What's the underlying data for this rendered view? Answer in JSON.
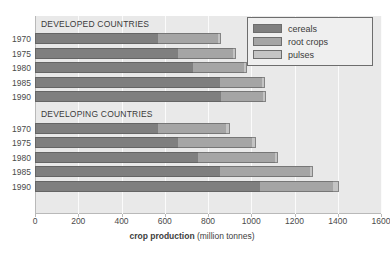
{
  "chart_data": {
    "type": "bar",
    "orientation": "horizontal",
    "stacked": true,
    "title": "",
    "xlabel_bold": "crop production",
    "xlabel_rest": " (million tonnes)",
    "ylabel": "",
    "xlim": [
      0,
      1600
    ],
    "xticks": [
      0,
      200,
      400,
      600,
      800,
      1000,
      1200,
      1400,
      1600
    ],
    "xtick_labels": [
      "0",
      "200",
      "400",
      "600",
      "800",
      "1000",
      "1200",
      "1400",
      "1600"
    ],
    "grid": true,
    "grid_axis": "x",
    "legend_position": "top-right",
    "legend": [
      "cereals",
      "root crops",
      "pulses"
    ],
    "series": [
      {
        "name": "cereals",
        "color": "#7f7f7f"
      },
      {
        "name": "root crops",
        "color": "#a5a5a5"
      },
      {
        "name": "pulses",
        "color": "#c4c4c4"
      }
    ],
    "groups": [
      {
        "caption": "DEVELOPED COUNTRIES",
        "categories": [
          "1970",
          "1975",
          "1980",
          "1985",
          "1990"
        ],
        "values": {
          "cereals": [
            570,
            660,
            730,
            855,
            860
          ],
          "root crops": [
            275,
            255,
            235,
            195,
            195
          ],
          "pulses": [
            15,
            15,
            15,
            15,
            15
          ]
        },
        "totals": [
          860,
          930,
          980,
          1065,
          1070
        ]
      },
      {
        "caption": "DEVELOPING COUNTRIES",
        "categories": [
          "1970",
          "1975",
          "1980",
          "1985",
          "1990"
        ],
        "values": {
          "cereals": [
            570,
            660,
            755,
            855,
            1040
          ],
          "root crops": [
            315,
            345,
            355,
            415,
            340
          ],
          "pulses": [
            15,
            15,
            15,
            15,
            25
          ]
        },
        "totals": [
          900,
          1020,
          1125,
          1285,
          1405
        ]
      }
    ]
  },
  "colors": {
    "plot_background": "#e9e9e9",
    "gridline": "#fbfbfb",
    "axis": "#b9b9b9",
    "text": "#4a4a4a",
    "legend_background": "#efefef",
    "legend_border": "#6d6d6d"
  }
}
